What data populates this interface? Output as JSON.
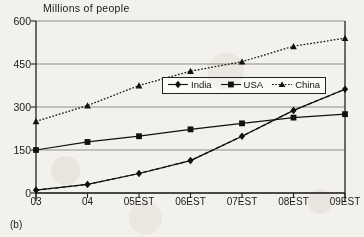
{
  "chart_data": {
    "type": "line",
    "title": "Millions of people",
    "caption": "(b)",
    "xlabel": "",
    "ylabel": "",
    "ylim": [
      0,
      600
    ],
    "yticks": [
      0,
      150,
      300,
      450,
      600
    ],
    "grid": true,
    "legend_position": "inside-upper-right",
    "categories": [
      "03",
      "04",
      "05EST",
      "06EST",
      "07EST",
      "08EST",
      "09EST"
    ],
    "series": [
      {
        "name": "India",
        "marker": "diamond",
        "line_style": "solid",
        "color": "#111111",
        "values": [
          10,
          30,
          68,
          113,
          198,
          288,
          362
        ]
      },
      {
        "name": "USA",
        "marker": "square",
        "line_style": "solid",
        "color": "#111111",
        "values": [
          150,
          178,
          198,
          222,
          243,
          263,
          275
        ]
      },
      {
        "name": "China",
        "marker": "triangle",
        "line_style": "dotted",
        "color": "#111111",
        "values": [
          250,
          305,
          375,
          425,
          458,
          512,
          540
        ]
      }
    ]
  },
  "axis": {
    "ytick_labels": [
      "600",
      "450",
      "300",
      "150",
      "0"
    ],
    "xtick_labels": [
      "03",
      "04",
      "05EST",
      "06EST",
      "07EST",
      "08EST",
      "09EST"
    ]
  },
  "legend": {
    "items": [
      {
        "label": "India"
      },
      {
        "label": "USA"
      },
      {
        "label": "China"
      }
    ]
  },
  "colors": {
    "ink": "#111111",
    "grid": "#8d8d8d",
    "axis": "#222222",
    "paper": "#f3f1ec",
    "legend_bg": "#fbfaf6"
  }
}
